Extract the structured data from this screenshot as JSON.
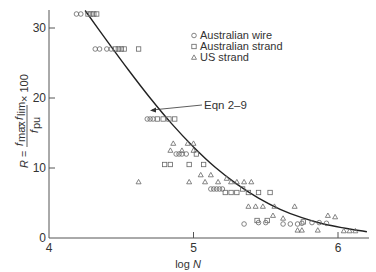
{
  "chart_data": {
    "type": "scatter",
    "title": "",
    "xlabel": "log N",
    "ylabel": "R = (f_max − f_lim) / f_pu × 100",
    "xlim": [
      4,
      6.2
    ],
    "ylim": [
      0,
      32
    ],
    "x_ticks": [
      "4",
      "5",
      "6"
    ],
    "y_ticks": [
      "0",
      "10",
      "20",
      "30"
    ],
    "grid": false,
    "legend_position": "upper right",
    "legend": [
      {
        "name": "Australian wire",
        "marker": "circle"
      },
      {
        "name": "Australian strand",
        "marker": "square"
      },
      {
        "name": "US strand",
        "marker": "triangle"
      }
    ],
    "annotations": [
      {
        "text": "Eqn 2–9",
        "points_to": {
          "x": 4.72,
          "y": 18.5
        }
      }
    ],
    "curve": {
      "name": "Eqn 2–9",
      "x": [
        4.25,
        4.4,
        4.55,
        4.7,
        4.85,
        5.0,
        5.15,
        5.3,
        5.45,
        5.6,
        5.75,
        5.9,
        6.05,
        6.2
      ],
      "y": [
        32.5,
        28.2,
        24.0,
        20.0,
        16.3,
        13.0,
        10.1,
        7.7,
        5.7,
        4.1,
        2.9,
        2.0,
        1.4,
        0.9
      ]
    },
    "series": [
      {
        "name": "Australian wire",
        "marker": "circle",
        "points": [
          [
            4.19,
            32
          ],
          [
            4.22,
            32
          ],
          [
            4.32,
            27
          ],
          [
            4.35,
            27
          ],
          [
            4.4,
            27
          ],
          [
            4.43,
            27
          ],
          [
            4.68,
            17
          ],
          [
            4.7,
            17
          ],
          [
            4.72,
            17
          ],
          [
            4.88,
            12
          ],
          [
            4.9,
            12
          ],
          [
            4.92,
            12
          ],
          [
            4.95,
            12
          ],
          [
            5.12,
            7
          ],
          [
            5.14,
            7
          ],
          [
            5.16,
            7
          ],
          [
            5.18,
            7
          ],
          [
            5.2,
            7
          ],
          [
            5.35,
            2
          ],
          [
            5.45,
            2.2
          ],
          [
            5.5,
            2.2
          ],
          [
            5.62,
            2
          ],
          [
            5.67,
            2
          ],
          [
            5.72,
            2
          ],
          [
            5.75,
            2.1
          ],
          [
            5.82,
            2.2
          ],
          [
            5.87,
            2.2
          ],
          [
            5.92,
            2.1
          ]
        ]
      },
      {
        "name": "Australian strand",
        "marker": "square",
        "points": [
          [
            4.27,
            32
          ],
          [
            4.29,
            32
          ],
          [
            4.31,
            32
          ],
          [
            4.33,
            32
          ],
          [
            4.46,
            27
          ],
          [
            4.48,
            27
          ],
          [
            4.5,
            27
          ],
          [
            4.52,
            27
          ],
          [
            4.62,
            27
          ],
          [
            4.75,
            17
          ],
          [
            4.79,
            17
          ],
          [
            4.83,
            17
          ],
          [
            4.87,
            17
          ],
          [
            4.8,
            10.5
          ],
          [
            4.84,
            10.5
          ],
          [
            4.97,
            10.5
          ],
          [
            5.02,
            12
          ],
          [
            5.07,
            10.5
          ],
          [
            5.22,
            6.5
          ],
          [
            5.26,
            6.5
          ],
          [
            5.3,
            6.5
          ],
          [
            5.34,
            7
          ],
          [
            5.38,
            6.5
          ],
          [
            5.45,
            6.5
          ],
          [
            5.53,
            6.5
          ],
          [
            5.44,
            2.5
          ],
          [
            5.51,
            2.5
          ],
          [
            5.76,
            2.3
          ]
        ]
      },
      {
        "name": "US strand",
        "marker": "triangle",
        "points": [
          [
            4.62,
            8
          ],
          [
            4.86,
            13.5
          ],
          [
            4.96,
            13.5
          ],
          [
            5.0,
            13.5
          ],
          [
            4.84,
            12.5
          ],
          [
            4.92,
            12.5
          ],
          [
            5.0,
            12.5
          ],
          [
            5.05,
            9
          ],
          [
            5.12,
            9
          ],
          [
            5.17,
            8
          ],
          [
            5.23,
            8.5
          ],
          [
            5.26,
            8
          ],
          [
            5.3,
            8
          ],
          [
            5.35,
            8
          ],
          [
            5.4,
            8
          ],
          [
            4.97,
            8
          ],
          [
            5.08,
            8
          ],
          [
            5.38,
            4.5
          ],
          [
            5.43,
            4.5
          ],
          [
            5.48,
            4.5
          ],
          [
            5.56,
            4.5
          ],
          [
            5.7,
            4.5
          ],
          [
            5.55,
            3.2
          ],
          [
            5.62,
            2.8
          ],
          [
            5.72,
            1.1
          ],
          [
            5.75,
            1.1
          ],
          [
            5.86,
            1.1
          ],
          [
            5.93,
            3.2
          ],
          [
            5.98,
            3.0
          ],
          [
            6.04,
            1.0
          ],
          [
            6.08,
            1.0
          ],
          [
            6.12,
            1.0
          ]
        ]
      }
    ]
  },
  "axes": {
    "x_label_prefix": "log ",
    "x_label_var": "N",
    "y_label_r": "R",
    "y_label_eq": "=",
    "y_label_num_a": "f",
    "y_label_num_a_sub": "max",
    "y_label_minus": "−",
    "y_label_num_b": "f",
    "y_label_num_b_sub": "lim",
    "y_label_den": "f",
    "y_label_den_sub": "pu",
    "y_label_times": "× 100"
  },
  "annotation_label": "Eqn 2–9"
}
